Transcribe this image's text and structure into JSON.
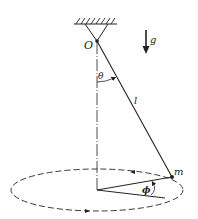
{
  "diagram": {
    "labels": {
      "pivot": "O",
      "gravity": "g",
      "polar_angle": "θ",
      "length": "l",
      "mass": "m",
      "azimuth": "ϕ"
    },
    "colors": {
      "line": "#222222",
      "background": "#ffffff"
    }
  }
}
